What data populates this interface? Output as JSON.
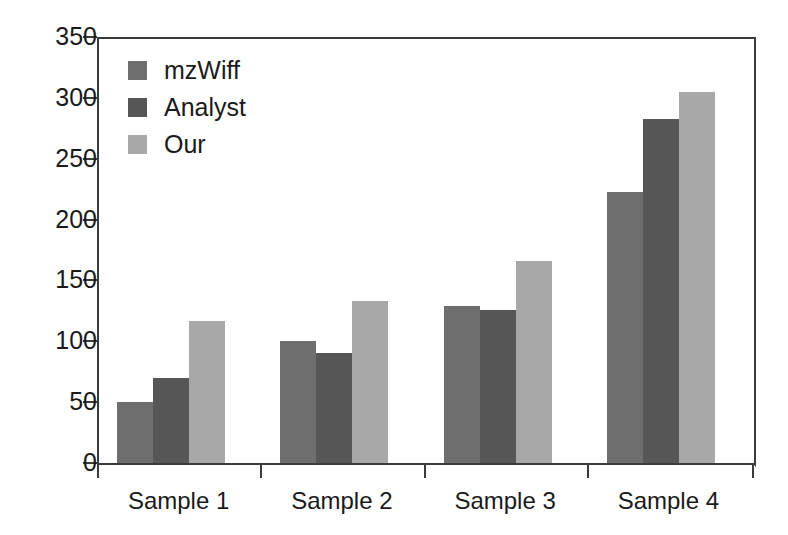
{
  "chart_data": {
    "type": "bar",
    "title": "",
    "xlabel": "",
    "ylabel": "",
    "categories": [
      "Sample 1",
      "Sample 2",
      "Sample 3",
      "Sample 4"
    ],
    "series": [
      {
        "name": "mzWiff",
        "color": "#6e6e6e",
        "values": [
          50,
          100,
          129,
          223
        ]
      },
      {
        "name": "Analyst",
        "color": "#565656",
        "values": [
          70,
          90,
          126,
          283
        ]
      },
      {
        "name": "Our",
        "color": "#a8a8a8",
        "values": [
          117,
          133,
          166,
          305
        ]
      }
    ],
    "ylim": [
      0,
      350
    ],
    "y_ticks": [
      0,
      50,
      100,
      150,
      200,
      250,
      300,
      350
    ],
    "y_tick_labels": [
      "0",
      "50",
      "100",
      "150",
      "200",
      "250",
      "300",
      "350"
    ],
    "grid": false,
    "legend_position": "upper left",
    "axis_color": "#3b3b3b",
    "background": "#ffffff"
  }
}
